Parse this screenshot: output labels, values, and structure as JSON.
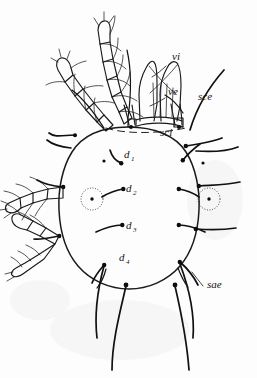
{
  "figure": {
    "kind": "scientific-illustration",
    "background_color": "#fdfdfd",
    "ink_color": "#141414",
    "width": 257,
    "height": 378
  },
  "labels": {
    "vi": {
      "text": "vi",
      "x": 172,
      "y": 60
    },
    "ve": {
      "text": "ve",
      "x": 168,
      "y": 95
    },
    "sce": {
      "text": "sce",
      "x": 198,
      "y": 100
    },
    "sci": {
      "text": "sci",
      "x": 160,
      "y": 136
    },
    "sae": {
      "text": "sae",
      "x": 207,
      "y": 288
    },
    "d1": {
      "base": "d",
      "sub": "1",
      "x": 124,
      "y": 158
    },
    "d2": {
      "base": "d",
      "sub": "2",
      "x": 126,
      "y": 192
    },
    "d3": {
      "base": "d",
      "sub": "3",
      "x": 126,
      "y": 229
    },
    "d4": {
      "base": "d",
      "sub": "4",
      "x": 119,
      "y": 261
    }
  },
  "anatomy": {
    "idiosoma": "oval body outline",
    "lyrifissure_left": "dotted circle with central dot",
    "lyrifissure_right": "dotted circle with central dot",
    "legs": [
      "leg-I",
      "leg-II",
      "leg-III",
      "leg-IV"
    ],
    "gnathosoma": "chelicerae and palps at anterior",
    "posterior_setae_count": 4
  }
}
